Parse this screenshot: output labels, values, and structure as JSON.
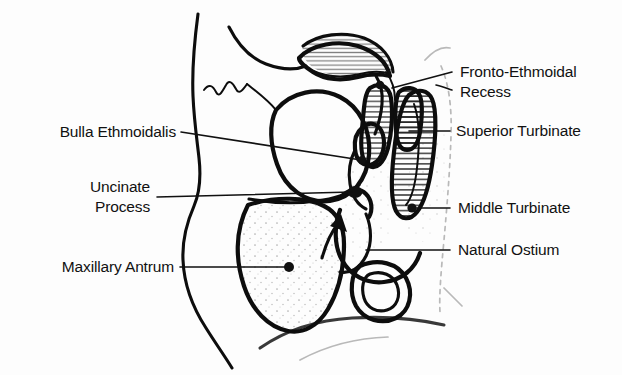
{
  "figure": {
    "kind": "anatomical-line-diagram",
    "background_color": "#fdfdfd",
    "ink_color": "#0d0d0d",
    "text_color": "#111111"
  },
  "labels": {
    "fronto_ethmoidal_recess": {
      "line1": "Fronto-Ethmoidal",
      "line2": "Recess",
      "side": "right"
    },
    "superior_turbinate": {
      "text": "Superior Turbinate",
      "side": "right"
    },
    "middle_turbinate": {
      "text": "Middle Turbinate",
      "side": "right"
    },
    "natural_ostium": {
      "text": "Natural Ostium",
      "side": "right"
    },
    "bulla_ethmoidalis": {
      "text": "Bulla Ethmoidalis",
      "side": "left"
    },
    "uncinate_process": {
      "line1": "Uncinate",
      "line2": "Process",
      "side": "left"
    },
    "maxillary_antrum": {
      "text": "Maxillary Antrum",
      "side": "left"
    }
  },
  "structures": [
    "facial-profile-contour",
    "frontal-sinus",
    "orbit",
    "nasal-bridge",
    "superior-turbinate",
    "middle-turbinate",
    "inferior-turbinate",
    "uncinate-process",
    "bulla-ethmoidalis",
    "maxillary-antrum",
    "hard-palate",
    "nasopharynx-wall",
    "airflow-arrow"
  ]
}
